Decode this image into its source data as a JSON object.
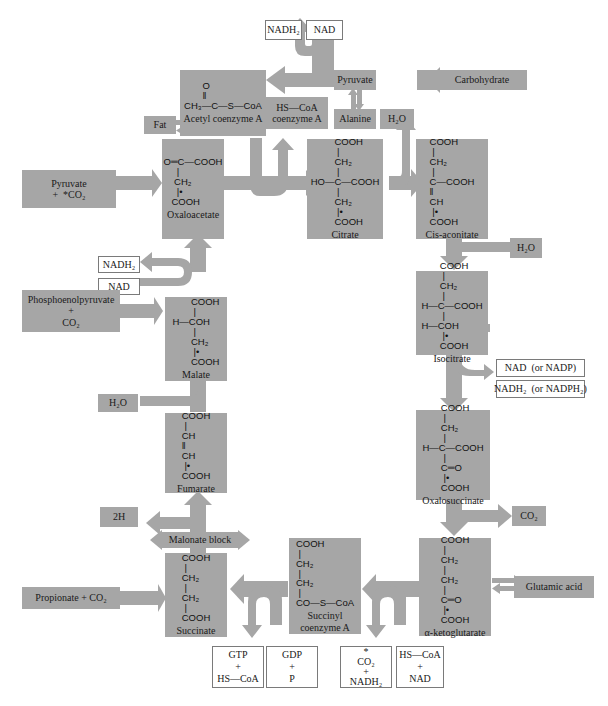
{
  "diagram": {
    "type": "metabolic-cycle",
    "topic": "Citric acid (Krebs) cycle",
    "colors": {
      "compound_box": "#a6a6a6",
      "arrow": "#a6a6a6",
      "cofactor_box_border": "#7a7a7a"
    }
  },
  "compounds": {
    "acetyl_coa": {
      "formula": "       O\n       ‖\nCH₃—C—S—CoA",
      "name": "Acetyl coenzyme A"
    },
    "oxaloacetate": {
      "formula": "O═C—COOH\n     |\n    CH₂\n     |•\n   COOH",
      "name": "Oxaloacetate"
    },
    "citrate": {
      "formula": "         COOH\n          |\n         CH₂\n          |\nHO—C—COOH\n          |\n         CH₂\n          |•\n         COOH",
      "name": "Citrate"
    },
    "cis_aconitate": {
      "formula": "COOH\n |\nCH₂\n |\nC—COOH\n‖\nCH\n |•\nCOOH",
      "name": "Cis-aconitate"
    },
    "isocitrate": {
      "formula": "       COOH\n        |\n       CH₂\n        |\nH—C—COOH\n        |\nH—COH\n        |•\n       COOH",
      "name": "Isocitrate"
    },
    "oxalosuccinate": {
      "formula": "       COOH\n        |\n       CH₂\n        |\nH—C—COOH\n        |\n       C═O\n        |•\n       COOH",
      "name": "Oxalosuccinate"
    },
    "alpha_ketoglutarate": {
      "formula": "COOH\n |\nCH₂\n |\nCH₂\n |\nC═O\n |•\nCOOH",
      "name": "α-ketoglutarate"
    },
    "succinyl_coa": {
      "formula": "COOH\n |\nCH₂\n |\nCH₂\n |\nCO—S—CoA",
      "name": "Succinyl\ncoenzyme A"
    },
    "succinate": {
      "formula": "COOH\n |\nCH₂\n |\nCH₂\n |\nCOOH",
      "name": "Succinate"
    },
    "fumarate": {
      "formula": "COOH\n |\nCH\n‖\nCH\n |•\nCOOH",
      "name": "Fumarate"
    },
    "malate": {
      "formula": "       COOH\n        |\nH—COH\n        |\n       CH₂\n        |•\n       COOH",
      "name": "Malate"
    }
  },
  "side_inputs": {
    "fat": "Fat",
    "pyruvate_top": "Pyruvate",
    "carbohydrate": "Carbohydrate",
    "alanine": "Alanine",
    "hs_coa_coenzyme_a": "HS—CoA\ncoenzyme A",
    "h2o_citrate": "H₂O",
    "pyruvate_co2": "Pyruvate\n+  *CO₂",
    "h2o_aconitate": "H₂O",
    "phosphoenolpyruvate": "Phosphoenolpyruvate\n+\nCO₂",
    "h2o_fumarate": "H₂O",
    "two_h": "2H",
    "malonate_block": "Malonate block",
    "propionate": "Propionate + CO₂",
    "co2_oxalosuccinate": "CO₂",
    "glutamic_acid": "Glutamic acid"
  },
  "cofactors": {
    "nadh2_top": "NADH₂",
    "nad_top": "NAD",
    "nadh2_malate": "NADH₂",
    "nad_malate": "NAD",
    "nad_isocitrate": "NAD  (or NADP)",
    "nadh2_isocitrate": "NADH₂  (or NADPH₂)",
    "gtp": "GTP\n+\nHS—CoA",
    "gdp": "GDP\n+\nP",
    "co2_nadh2": "*\nCO₂\n+\nNADH₂",
    "hscoa_nad": "HS—CoA\n+\nNAD"
  }
}
